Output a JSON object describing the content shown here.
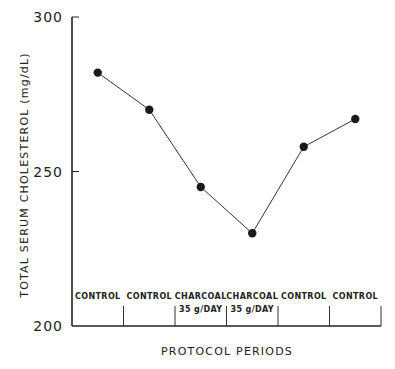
{
  "chart_data": {
    "type": "line",
    "title": "",
    "xlabel": "PROTOCOL PERIODS",
    "ylabel": "TOTAL SERUM CHOLESTEROL (mg/dL)",
    "ylim": [
      200,
      300
    ],
    "yticks": [
      200,
      250,
      300
    ],
    "ytick_labels": [
      "200",
      "250",
      "300"
    ],
    "grid": false,
    "legend": "none",
    "categories": [
      {
        "line1": "CONTROL",
        "line2": ""
      },
      {
        "line1": "CONTROL",
        "line2": ""
      },
      {
        "line1": "CHARCOAL",
        "line2": "35 g/DAY"
      },
      {
        "line1": "CHARCOAL",
        "line2": "35 g/DAY"
      },
      {
        "line1": "CONTROL",
        "line2": ""
      },
      {
        "line1": "CONTROL",
        "line2": ""
      }
    ],
    "series": [
      {
        "name": "Total serum cholesterol",
        "values": [
          282,
          270,
          245,
          230,
          258,
          267
        ],
        "marker": "filled-circle",
        "color": "#1a1a1a"
      }
    ]
  }
}
